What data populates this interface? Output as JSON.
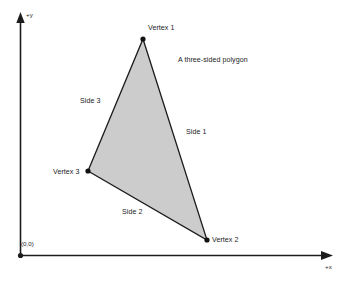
{
  "figure": {
    "caption": "A three-sided polygon",
    "background_color": "#ffffff",
    "axes": {
      "origin_label": "(0,0)",
      "y_axis_label": "+y",
      "x_axis_label": "+x",
      "axis_color": "#1c1c1c",
      "origin_point": {
        "x": 20,
        "y": 255
      },
      "x_axis_end": {
        "x": 333,
        "y": 255
      },
      "y_axis_end": {
        "x": 20,
        "y": 13
      }
    },
    "polygon": {
      "name": "triangle",
      "sides": 3,
      "fill_color": "#cccccc",
      "stroke_color": "#1c1c1c",
      "vertices": [
        {
          "label": "Vertex 1",
          "x": 143,
          "y": 39
        },
        {
          "label": "Vertex 2",
          "x": 207,
          "y": 240
        },
        {
          "label": "Vertex 3",
          "x": 88,
          "y": 171
        }
      ],
      "edges": [
        {
          "label": "Side 1",
          "from": "Vertex 1",
          "to": "Vertex 2"
        },
        {
          "label": "Side 2",
          "from": "Vertex 2",
          "to": "Vertex 3"
        },
        {
          "label": "Side 3",
          "from": "Vertex 3",
          "to": "Vertex 1"
        }
      ]
    }
  }
}
